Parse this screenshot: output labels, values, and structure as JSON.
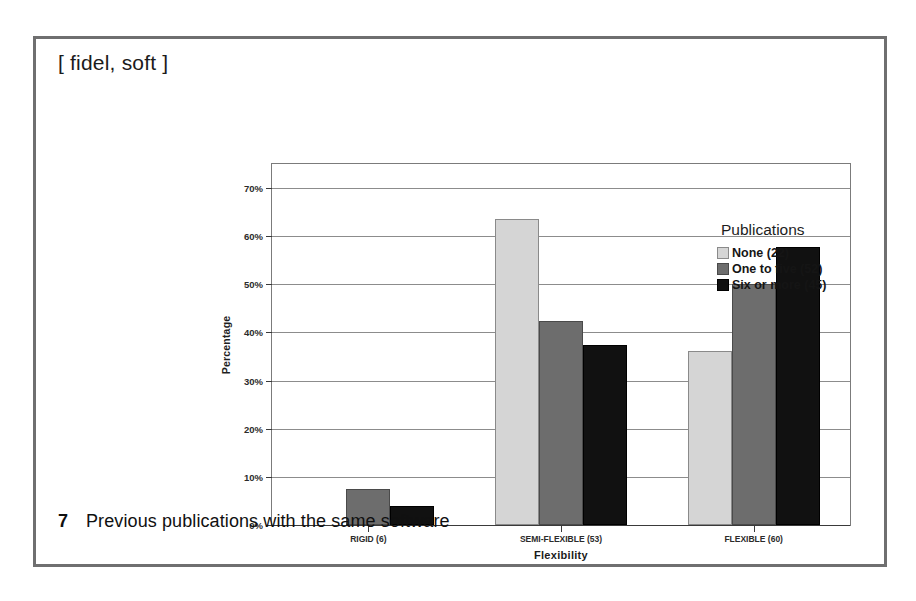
{
  "figure": {
    "header": "[ fidel, soft ]",
    "caption_number": "7",
    "caption_text": "Previous publications with the same software"
  },
  "legend": {
    "title": "Publications",
    "entries": [
      {
        "label": "None (22)",
        "color": "#d5d5d5"
      },
      {
        "label": "One to five (52)",
        "color": "#6d6d6d"
      },
      {
        "label": "Six or more (45)",
        "color": "#111111"
      }
    ]
  },
  "chart_data": {
    "type": "bar",
    "title": "",
    "xlabel": "Flexibility",
    "ylabel": "Percentage",
    "categories": [
      "RIGID (6)",
      "SEMI-FLEXIBLE (53)",
      "FLEXIBLE (60)"
    ],
    "series": [
      {
        "name": "None (22)",
        "color": "#d5d5d5",
        "values": [
          0,
          63.6,
          36.2
        ]
      },
      {
        "name": "One to five (52)",
        "color": "#6d6d6d",
        "values": [
          7.4,
          42.4,
          50.0
        ]
      },
      {
        "name": "Six or more (45)",
        "color": "#111111",
        "values": [
          4.0,
          37.5,
          57.8
        ]
      }
    ],
    "ylim": [
      0,
      75
    ],
    "yticks": [
      0,
      10,
      20,
      30,
      40,
      50,
      60,
      70
    ],
    "ytick_labels": [
      "0%",
      "10%",
      "20%",
      "30%",
      "40%",
      "50%",
      "60%",
      "70%"
    ],
    "grid": true,
    "legend_position": "right"
  }
}
